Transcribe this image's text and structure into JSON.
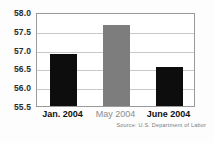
{
  "chart_data": {
    "type": "bar",
    "title": "",
    "xlabel": "",
    "ylabel": "",
    "categories": [
      "Jan. 2004",
      "May 2004",
      "June 2004"
    ],
    "values": [
      56.88,
      57.65,
      56.53
    ],
    "series": [
      {
        "name": "Employment-population ratio",
        "values": [
          56.88,
          57.65,
          56.53
        ]
      }
    ],
    "bar_colors": [
      "#0d0d0d",
      "#7d7d7d",
      "#0d0d0d"
    ],
    "label_colors": [
      "#111111",
      "#8c8c8c",
      "#111111"
    ],
    "ylim": [
      55.5,
      58.0
    ],
    "yticks": [
      "58.0",
      "57.5",
      "57.0",
      "56.5",
      "56.0",
      "55.5"
    ],
    "ytick_values": [
      58.0,
      57.5,
      57.0,
      56.5,
      56.0,
      55.5
    ],
    "grid": true,
    "legend": "none",
    "source": "Source: U.S. Department of Labor"
  },
  "colors": {
    "bar_dark": "#0d0d0d",
    "bar_gray": "#7d7d7d",
    "gridline": "#c9c9c9",
    "frame": "#9a9a9a",
    "tick_text": "#2b2b2b",
    "source_text": "#7a7a7a",
    "background": "#fdfdfd"
  }
}
